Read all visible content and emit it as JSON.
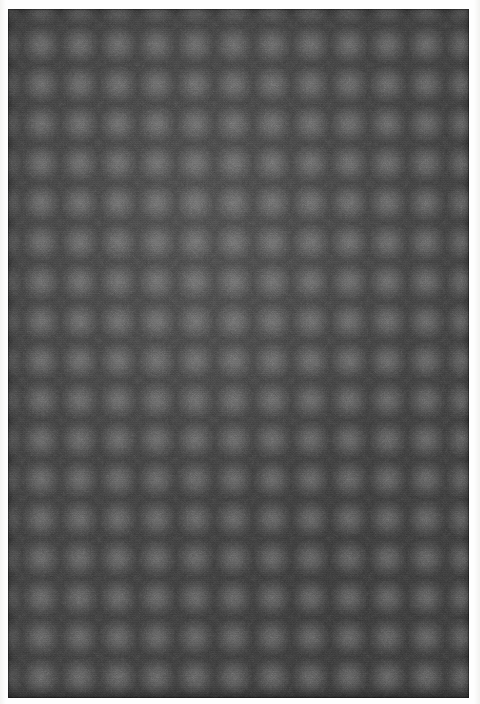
{
  "image": {
    "kind": "texture-swatch-photograph",
    "subject": "dark charcoal panel with a regular square grid of soft circular dots",
    "width_px": 480,
    "height_px": 704,
    "caption": ""
  },
  "margin": {
    "name": "paper-margin",
    "color": "#fdfdfc"
  },
  "panel": {
    "name": "texture-panel",
    "left_px": 8,
    "top_px": 9,
    "width_px": 461,
    "height_px": 689,
    "background_color": "#3b3b3b",
    "shadow_color": "#2a2a2a",
    "label": ""
  },
  "pattern": {
    "type": "square-grid-of-dots",
    "dot_color": "#5e5e5e",
    "dot_diameter_px": 24,
    "pitch_x_px": 38.5,
    "pitch_y_px": 39.5,
    "offset_x_px": 14,
    "offset_y_px": 16,
    "columns": 12,
    "rows": 18,
    "edge_softness": "gaussian",
    "row_offset": "none"
  },
  "noise": {
    "type": "film-grain",
    "opacity": 0.5,
    "scanline_banding": true,
    "weave_micro_texture": true
  },
  "palette": {
    "background_dark": "#3a3a3a",
    "background_light": "#414141",
    "dot_peak": "#5e5e5e",
    "edge_dark": "#2e2e2e",
    "paper_white": "#fdfdfc"
  }
}
